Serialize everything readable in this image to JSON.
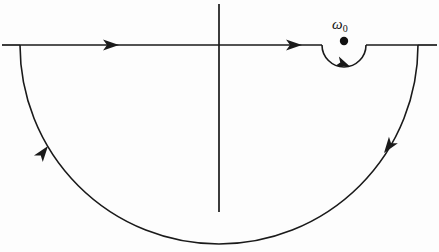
{
  "figure": {
    "kind": "complex-plane-contour-diagram",
    "width": 439,
    "height": 252,
    "background_color": "#fdfdfd",
    "ink_color": "#1a1a1a"
  },
  "axes": {
    "real_axis": {
      "name": "real-axis",
      "y": 45,
      "x_start": 2,
      "x_end": 437
    },
    "imaginary_axis": {
      "name": "imaginary-axis",
      "x": 219,
      "y_start": 4,
      "y_end": 212
    }
  },
  "contour": {
    "name": "closed-contour",
    "description": "Real axis traversed left to right with a small semicircular indentation dipping below the simple pole, closed by a large semicircular arc in the lower half plane.",
    "big_arc": {
      "center_x": 219,
      "center_y": 45,
      "radius_x": 199,
      "radius_y": 199,
      "left_endpoint_x": 20,
      "right_endpoint_x": 418,
      "bottom_y": 244,
      "half_plane": "lower"
    },
    "indent_arc": {
      "center_x": 344,
      "center_y": 45,
      "radius": 22,
      "direction": "below-the-pole",
      "left_endpoint_x": 322,
      "right_endpoint_x": 366,
      "bottom_y": 67
    },
    "direction_arrows": [
      {
        "name": "arrow-real-axis-left",
        "x": 118,
        "y": 45,
        "angle_deg": 0,
        "on": "real-axis-left-segment"
      },
      {
        "name": "arrow-real-axis-right",
        "x": 301,
        "y": 45,
        "angle_deg": 0,
        "on": "real-axis-right-segment"
      },
      {
        "name": "arrow-indent-arc",
        "x": 347,
        "y": 66,
        "angle_deg": 25,
        "on": "pole-indentation"
      },
      {
        "name": "arrow-big-arc-right",
        "x": 387,
        "y": 150,
        "angle_deg": 128,
        "on": "big-arc-right-descending"
      },
      {
        "name": "arrow-big-arc-left",
        "x": 46,
        "y": 149,
        "angle_deg": -52,
        "on": "big-arc-left-ascending"
      }
    ]
  },
  "pole": {
    "name": "simple-pole",
    "marker": "filled-dot",
    "x": 344,
    "y": 41,
    "radius": 4,
    "label": "ω",
    "label_subscript": "0",
    "label_x": 332,
    "label_y": 18
  }
}
